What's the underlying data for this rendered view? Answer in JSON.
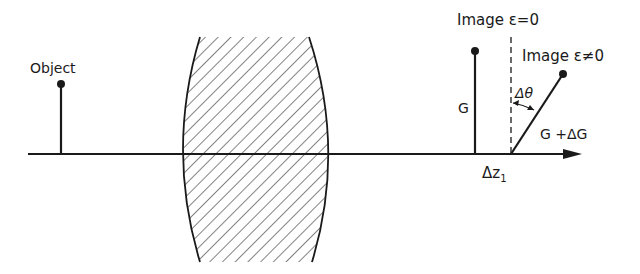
{
  "diagram": {
    "type": "optical-imaging-schematic",
    "labels": {
      "object": "Object",
      "image_eps0": "Image ε=0",
      "image_epsne0": "Image ε≠0",
      "height_G": "G",
      "height_G_dG": "G +ΔG",
      "delta_theta": "Δθ",
      "delta_z": "Δz",
      "delta_z_sub": "1"
    },
    "elements": [
      {
        "name": "optical-axis",
        "kind": "arrow",
        "from": [
          28,
          154
        ],
        "to": [
          582,
          154
        ]
      },
      {
        "name": "lens",
        "kind": "hatched-biconvex",
        "x_left": 183,
        "x_right": 328,
        "y_top": 37,
        "y_bottom": 262
      },
      {
        "name": "object",
        "kind": "stem-with-dot",
        "x": 61,
        "y_top": 83
      },
      {
        "name": "image-eps-0",
        "kind": "stem-with-dot",
        "x": 475,
        "y_top": 50
      },
      {
        "name": "reference-dashed-line",
        "kind": "dashed",
        "x": 511,
        "y_top": 37
      },
      {
        "name": "image-eps-ne-0",
        "kind": "tilted-stem-with-dot",
        "from": [
          511,
          154
        ],
        "to": [
          563,
          73
        ]
      }
    ],
    "colors": {
      "ink": "#1a1a1a",
      "background": "#ffffff"
    }
  }
}
